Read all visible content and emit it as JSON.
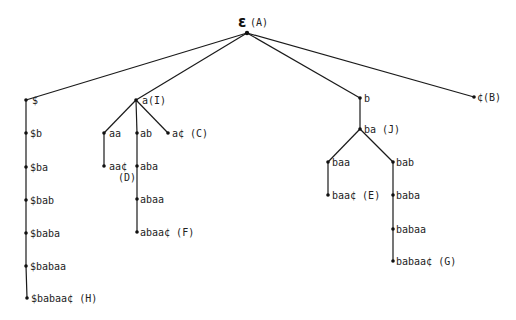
{
  "diagram": {
    "type": "suffix-trie",
    "root": {
      "id": "root",
      "symbol": "ε",
      "tag": "(A)",
      "x": 247,
      "y": 33
    },
    "nodes": [
      {
        "id": "n_dollar",
        "label": "$",
        "x": 26,
        "y": 100,
        "lx": 32,
        "ly": 104
      },
      {
        "id": "n_dollar_b",
        "label": "$b",
        "x": 26,
        "y": 133,
        "lx": 30,
        "ly": 137
      },
      {
        "id": "n_dollar_ba",
        "label": "$ba",
        "x": 26,
        "y": 167,
        "lx": 30,
        "ly": 171
      },
      {
        "id": "n_dollar_bab",
        "label": "$bab",
        "x": 26,
        "y": 200,
        "lx": 30,
        "ly": 204
      },
      {
        "id": "n_dollar_baba",
        "label": "$baba",
        "x": 26,
        "y": 233,
        "lx": 30,
        "ly": 237
      },
      {
        "id": "n_dollar_babaa",
        "label": "$babaa",
        "x": 26,
        "y": 266,
        "lx": 30,
        "ly": 270
      },
      {
        "id": "n_dollar_babaac",
        "label": "$babaa¢ (H)",
        "x": 27,
        "y": 298,
        "lx": 31,
        "ly": 302
      },
      {
        "id": "n_a",
        "label": "a(I)",
        "x": 136,
        "y": 100,
        "lx": 142,
        "ly": 104
      },
      {
        "id": "n_aa",
        "label": "aa",
        "x": 104,
        "y": 133,
        "lx": 109,
        "ly": 137
      },
      {
        "id": "n_aac",
        "label": "aa¢",
        "x": 104,
        "y": 166,
        "lx": 109,
        "ly": 170
      },
      {
        "id": "n_aac_tag",
        "label": "(D)",
        "x": 0,
        "y": 0,
        "lx": 118,
        "ly": 181
      },
      {
        "id": "n_ab",
        "label": "ab",
        "x": 137,
        "y": 133,
        "lx": 140,
        "ly": 137
      },
      {
        "id": "n_aba",
        "label": "aba",
        "x": 137,
        "y": 166,
        "lx": 140,
        "ly": 170
      },
      {
        "id": "n_abaa",
        "label": "abaa",
        "x": 137,
        "y": 199,
        "lx": 140,
        "ly": 203
      },
      {
        "id": "n_abaac",
        "label": "abaa¢ (F)",
        "x": 137,
        "y": 232,
        "lx": 140,
        "ly": 236
      },
      {
        "id": "n_ac",
        "label": "a¢ (C)",
        "x": 168,
        "y": 133,
        "lx": 172,
        "ly": 137
      },
      {
        "id": "n_b",
        "label": "b",
        "x": 360,
        "y": 98,
        "lx": 364,
        "ly": 102
      },
      {
        "id": "n_ba",
        "label": "ba (J)",
        "x": 360,
        "y": 129,
        "lx": 364,
        "ly": 133
      },
      {
        "id": "n_baa",
        "label": "baa",
        "x": 328,
        "y": 162,
        "lx": 332,
        "ly": 166
      },
      {
        "id": "n_baac",
        "label": "baa¢ (E)",
        "x": 328,
        "y": 195,
        "lx": 332,
        "ly": 199
      },
      {
        "id": "n_bab",
        "label": "bab",
        "x": 393,
        "y": 162,
        "lx": 396,
        "ly": 166
      },
      {
        "id": "n_baba",
        "label": "baba",
        "x": 393,
        "y": 195,
        "lx": 396,
        "ly": 199
      },
      {
        "id": "n_babaa",
        "label": "babaa",
        "x": 393,
        "y": 229,
        "lx": 396,
        "ly": 233
      },
      {
        "id": "n_babaac",
        "label": "babaa¢ (G)",
        "x": 393,
        "y": 261,
        "lx": 396,
        "ly": 265
      },
      {
        "id": "n_cent",
        "label": "¢(B)",
        "x": 474,
        "y": 97,
        "lx": 477,
        "ly": 101
      }
    ],
    "edges": [
      [
        "root",
        "n_dollar"
      ],
      [
        "root",
        "n_a"
      ],
      [
        "root",
        "n_b"
      ],
      [
        "root",
        "n_cent"
      ],
      [
        "n_dollar",
        "n_dollar_b"
      ],
      [
        "n_dollar_b",
        "n_dollar_ba"
      ],
      [
        "n_dollar_ba",
        "n_dollar_bab"
      ],
      [
        "n_dollar_bab",
        "n_dollar_baba"
      ],
      [
        "n_dollar_baba",
        "n_dollar_babaa"
      ],
      [
        "n_dollar_babaa",
        "n_dollar_babaac"
      ],
      [
        "n_a",
        "n_aa"
      ],
      [
        "n_a",
        "n_ab"
      ],
      [
        "n_a",
        "n_ac"
      ],
      [
        "n_aa",
        "n_aac"
      ],
      [
        "n_ab",
        "n_aba"
      ],
      [
        "n_aba",
        "n_abaa"
      ],
      [
        "n_abaa",
        "n_abaac"
      ],
      [
        "n_b",
        "n_ba"
      ],
      [
        "n_ba",
        "n_baa"
      ],
      [
        "n_ba",
        "n_bab"
      ],
      [
        "n_baa",
        "n_baac"
      ],
      [
        "n_bab",
        "n_baba"
      ],
      [
        "n_baba",
        "n_babaa"
      ],
      [
        "n_babaa",
        "n_babaac"
      ]
    ]
  }
}
